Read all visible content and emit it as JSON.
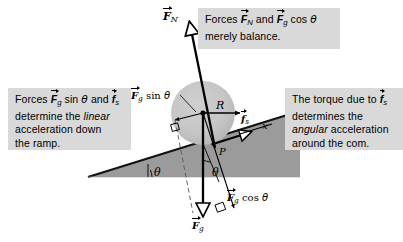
{
  "figure": {
    "background_color": "#ffffff",
    "callout_background": "#d9d9d9",
    "ramp_fill": "#9b9b9b",
    "wheel_fill": "#c4c4c4"
  },
  "callouts": {
    "balance": {
      "line1_pre": "Forces ",
      "vec_FN": "F",
      "vec_FN_sub": "N",
      "mid": " and ",
      "vec_Fg": "F",
      "vec_Fg_sub": "g",
      "trig": " cos ",
      "theta": "θ",
      "line2": "merely balance."
    },
    "linear": {
      "line1_pre": "Forces ",
      "vec_Fg": "F",
      "vec_Fg_sub": "g",
      "trig": " sin ",
      "theta": "θ",
      "mid": " and ",
      "vec_fs": "f",
      "vec_fs_sub": "s",
      "line2_pre": "determine the ",
      "line2_em": "linear",
      "line3": "acceleration down",
      "line4": "the ramp."
    },
    "torque": {
      "line1_pre": "The torque due to ",
      "vec_fs": "f",
      "vec_fs_sub": "s",
      "line2": "determines the",
      "line3_em": "angular",
      "line3_post": " acceleration",
      "line4": "around the com."
    }
  },
  "diagram_labels": {
    "normal_force": {
      "symbol": "F",
      "subscript": "N"
    },
    "gravity_sin": {
      "symbol": "F",
      "subscript": "g",
      "trig": " sin ",
      "theta": "θ"
    },
    "gravity_cos": {
      "symbol": "F",
      "subscript": "g",
      "trig": " cos ",
      "theta": "θ"
    },
    "gravity": {
      "symbol": "F",
      "subscript": "g"
    },
    "friction": {
      "symbol": "f",
      "subscript": "s"
    },
    "radius": "R",
    "contact_point": "P",
    "x_axis": "x",
    "ramp_angle": "θ",
    "vertical_angle": "θ"
  },
  "geometry": {
    "wheel_center": {
      "x": 203,
      "y": 113
    },
    "wheel_radius": 32,
    "contact_point": {
      "x": 213,
      "y": 144
    },
    "ramp_apex": {
      "x": 88,
      "y": 177
    },
    "ramp_angle_degrees": 18
  }
}
